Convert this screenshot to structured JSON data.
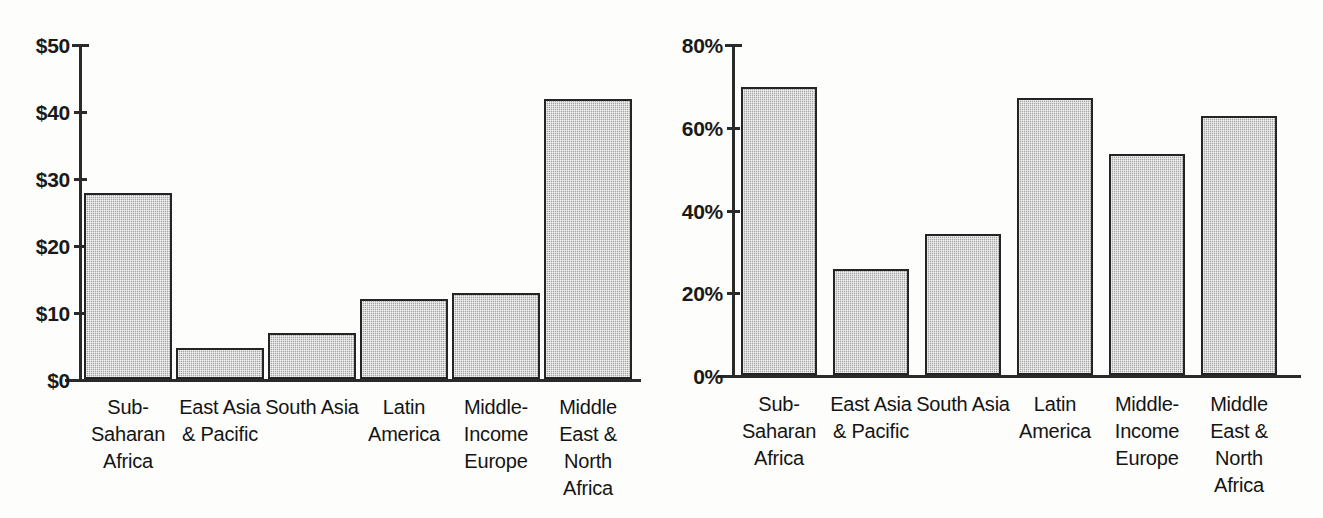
{
  "chart_data": [
    {
      "panel": "left",
      "type": "bar",
      "title": "",
      "xlabel": "",
      "ylabel": "",
      "ylim": [
        0,
        50
      ],
      "yticks": [
        0,
        10,
        20,
        30,
        40,
        50
      ],
      "ytick_labels": [
        "$0",
        "$10",
        "$20",
        "$30",
        "$40",
        "$50"
      ],
      "grid": false,
      "legend": "none",
      "value_prefix": "$",
      "categories": [
        "Sub-Saharan Africa",
        "East Asia & Pacific",
        "South Asia",
        "Latin America",
        "Middle-Income Europe",
        "Middle East & North Africa"
      ],
      "category_lines": [
        [
          "Sub-",
          "Saharan",
          "Africa"
        ],
        [
          "East Asia",
          "& Pacific"
        ],
        [
          "South Asia"
        ],
        [
          "Latin",
          "America"
        ],
        [
          "Middle-",
          "Income",
          "Europe"
        ],
        [
          "Middle",
          "East &",
          "North",
          "Africa"
        ]
      ],
      "values": [
        27.8,
        4.6,
        6.8,
        12.0,
        12.9,
        41.8
      ]
    },
    {
      "panel": "right",
      "type": "bar",
      "title": "",
      "xlabel": "",
      "ylabel": "",
      "ylim": [
        0,
        80
      ],
      "yticks": [
        0,
        20,
        40,
        60,
        80
      ],
      "ytick_labels": [
        "0%",
        "20%",
        "40%",
        "60%",
        "80%"
      ],
      "grid": false,
      "legend": "none",
      "value_suffix": "%",
      "categories": [
        "Sub-Saharan Africa",
        "East Asia & Pacific",
        "South Asia",
        "Latin America",
        "Middle-Income Europe",
        "Middle East & North Africa"
      ],
      "category_lines": [
        [
          "Sub-",
          "Saharan",
          "Africa"
        ],
        [
          "East Asia",
          "& Pacific"
        ],
        [
          "South Asia"
        ],
        [
          "Latin",
          "America"
        ],
        [
          "Middle-",
          "Income",
          "Europe"
        ],
        [
          "Middle",
          "East &",
          "North",
          "Africa"
        ]
      ],
      "values": [
        69.5,
        25.5,
        34.0,
        67.0,
        53.5,
        62.5
      ]
    }
  ],
  "style": {
    "bar_fill": "#b9b9b9",
    "bar_border": "#242424",
    "axis_color": "#2a2a2a",
    "text_color": "#141414",
    "background": "#fdfdfc"
  }
}
